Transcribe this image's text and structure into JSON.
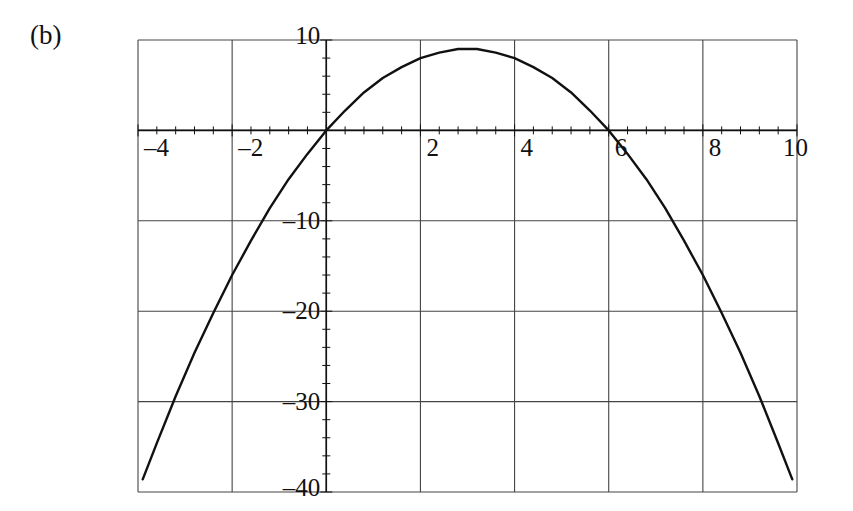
{
  "figure": {
    "panel_label": "(b)",
    "background_color": "#ffffff",
    "ink_color": "#111111",
    "grid_color": "#444444"
  },
  "chart_data": {
    "type": "line",
    "title": "",
    "subtitle": "",
    "xlabel": "",
    "ylabel": "",
    "xlim": [
      -4,
      10
    ],
    "ylim": [
      -40,
      10
    ],
    "grid": true,
    "legend": null,
    "annotations": [
      "(b)"
    ],
    "x_ticks": [
      -4,
      -2,
      2,
      4,
      6,
      8,
      10
    ],
    "x_tick_labels": [
      "–4",
      "–2",
      "2",
      "4",
      "6",
      "8",
      "10"
    ],
    "y_ticks": [
      10,
      -10,
      -20,
      -30,
      -40
    ],
    "y_tick_labels": [
      "10",
      "–10",
      "–20",
      "–30",
      "–40"
    ],
    "x_major_step": 2,
    "y_major_step": 10,
    "x_minor_ticks_per_major": 4,
    "y_minor_ticks_per_major": 4,
    "axis_lines": {
      "x_axis_at_y": 0,
      "y_axis_at_x": 0
    },
    "series": [
      {
        "name": "parabola",
        "equation": "y = -x^2 + 6x",
        "vertex": [
          3,
          9
        ],
        "roots": [
          0,
          6
        ],
        "x": [
          -3.9,
          -3.6,
          -3.2,
          -2.8,
          -2.4,
          -2.0,
          -1.6,
          -1.2,
          -0.8,
          -0.4,
          0.0,
          0.4,
          0.8,
          1.2,
          1.6,
          2.0,
          2.4,
          2.8,
          3.0,
          3.2,
          3.6,
          4.0,
          4.4,
          4.8,
          5.2,
          5.6,
          6.0,
          6.4,
          6.8,
          7.2,
          7.6,
          8.0,
          8.4,
          8.8,
          9.2,
          9.6,
          9.9
        ],
        "y": [
          -38.6,
          -34.6,
          -29.4,
          -24.6,
          -20.2,
          -16.0,
          -12.2,
          -8.6,
          -5.4,
          -2.6,
          0.0,
          2.2,
          4.2,
          5.8,
          7.0,
          8.0,
          8.6,
          9.0,
          9.0,
          9.0,
          8.6,
          8.0,
          7.0,
          5.8,
          4.2,
          2.2,
          0.0,
          -2.6,
          -5.4,
          -8.6,
          -12.2,
          -16.0,
          -20.2,
          -24.6,
          -29.4,
          -34.6,
          -38.6
        ]
      }
    ]
  },
  "geometry": {
    "plot_left_px": 138,
    "plot_right_px": 797,
    "plot_top_px": 40,
    "plot_bottom_px": 492,
    "x_axis_y_px": 132,
    "y_axis_x_px": 327
  }
}
